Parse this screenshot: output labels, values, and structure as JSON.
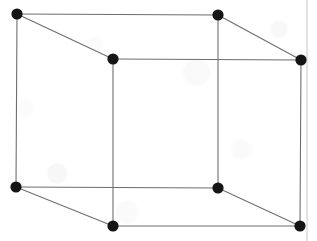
{
  "figure": {
    "kind": "line-drawing",
    "background_color": "#fefefe",
    "canvas": {
      "width": 317,
      "height": 241
    }
  },
  "style": {
    "edge_color": "#6e6e6e",
    "edge_color_dark": "#555555",
    "edge_width": 1.1,
    "vertex_color": "#151515",
    "vertex_radius": 5.6,
    "artifact_color": "#c9c9c9",
    "artifact_width": 1
  },
  "vertices": [
    {
      "id": "back-top-left",
      "label": "back top left",
      "x": 17,
      "y": 14
    },
    {
      "id": "back-top-right",
      "label": "back top right",
      "x": 218,
      "y": 15
    },
    {
      "id": "front-top-left",
      "label": "front top left",
      "x": 113,
      "y": 59
    },
    {
      "id": "front-top-right",
      "label": "front top right",
      "x": 301,
      "y": 60
    },
    {
      "id": "back-bottom-left",
      "label": "back bottom left",
      "x": 16,
      "y": 187
    },
    {
      "id": "back-bottom-right",
      "label": "back bottom right",
      "x": 218,
      "y": 188
    },
    {
      "id": "front-bottom-left",
      "label": "front bottom left",
      "x": 113,
      "y": 226
    },
    {
      "id": "front-bottom-right",
      "label": "front bottom right",
      "x": 300,
      "y": 226
    }
  ],
  "edges": [
    {
      "id": "edge-back-top",
      "label": "back top edge",
      "from": "back-top-left",
      "to": "back-top-right"
    },
    {
      "id": "edge-back-left-vertical",
      "label": "back left vertical edge",
      "from": "back-top-left",
      "to": "back-bottom-left"
    },
    {
      "id": "edge-back-bottom",
      "label": "back bottom edge",
      "from": "back-bottom-left",
      "to": "back-bottom-right"
    },
    {
      "id": "edge-back-right-vertical",
      "label": "back right vertical edge",
      "from": "back-top-right",
      "to": "back-bottom-right"
    },
    {
      "id": "edge-front-top",
      "label": "front top edge",
      "from": "front-top-left",
      "to": "front-top-right"
    },
    {
      "id": "edge-front-left-vertical",
      "label": "front left vertical edge",
      "from": "front-top-left",
      "to": "front-bottom-left"
    },
    {
      "id": "edge-front-bottom",
      "label": "front bottom edge",
      "from": "front-bottom-left",
      "to": "front-bottom-right"
    },
    {
      "id": "edge-front-right-vertical",
      "label": "front right vertical edge",
      "from": "front-top-right",
      "to": "front-bottom-right"
    },
    {
      "id": "edge-diag-top-left",
      "label": "top left depth edge",
      "from": "back-top-left",
      "to": "front-top-left"
    },
    {
      "id": "edge-diag-top-right",
      "label": "top right depth edge",
      "from": "back-top-right",
      "to": "front-top-right"
    },
    {
      "id": "edge-diag-bottom-left",
      "label": "bottom left depth edge",
      "from": "back-bottom-left",
      "to": "front-bottom-left"
    },
    {
      "id": "edge-diag-bottom-right",
      "label": "bottom right depth edge",
      "from": "back-bottom-right",
      "to": "front-bottom-right"
    }
  ],
  "artifacts": [
    {
      "id": "right-margin-line",
      "label": "page margin scan line",
      "x1": 307,
      "y1": 0,
      "x2": 307,
      "y2": 241
    }
  ]
}
